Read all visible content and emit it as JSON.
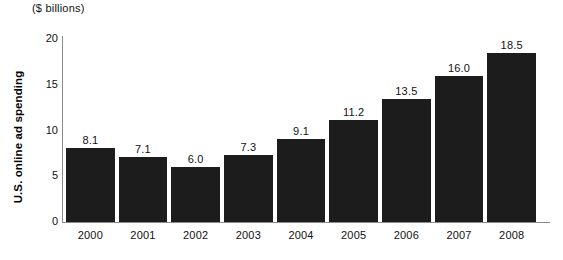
{
  "chart_data": {
    "type": "bar",
    "title": "",
    "unit_note": "($ billions)",
    "xlabel": "",
    "ylabel": "U.S. online ad spending",
    "categories": [
      "2000",
      "2001",
      "2002",
      "2003",
      "2004",
      "2005",
      "2006",
      "2007",
      "2008"
    ],
    "values": [
      8.1,
      7.1,
      6.0,
      7.3,
      9.1,
      11.2,
      13.5,
      16.0,
      18.5
    ],
    "value_labels": [
      "8.1",
      "7.1",
      "6.0",
      "7.3",
      "9.1",
      "11.2",
      "13.5",
      "16.0",
      "18.5"
    ],
    "ylim": [
      0,
      21
    ],
    "yticks": [
      0,
      5,
      10,
      15,
      20
    ],
    "ytick_labels": [
      "0",
      "5",
      "10",
      "15",
      "20"
    ],
    "grid": false,
    "legend": false,
    "bar_color": "#1c1c1c",
    "axis_color": "#8a8a8a",
    "text_color": "#111111"
  }
}
